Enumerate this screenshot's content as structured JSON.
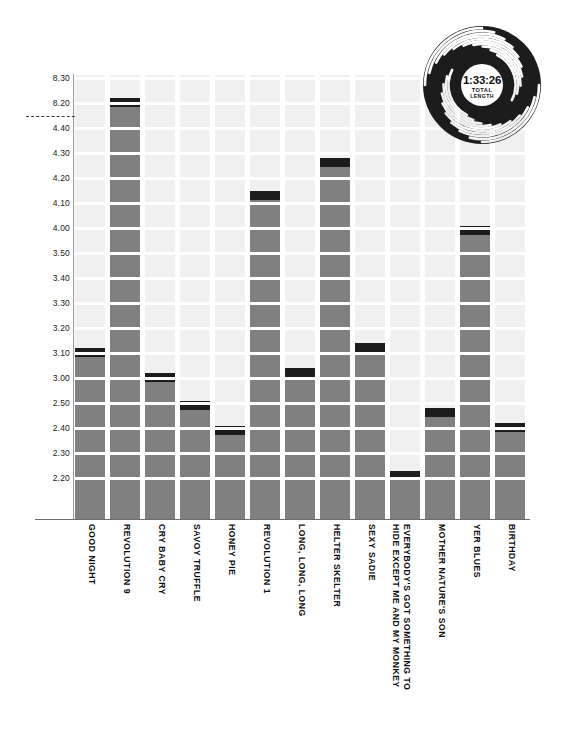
{
  "chart_data": {
    "type": "bar",
    "title": "",
    "subtitle": "",
    "xlabel": "",
    "ylabel": "",
    "grid": true,
    "legend_position": "none",
    "axis_note": "broken y-axis between 8.20 and 4.40",
    "y_unit": "minutes:seconds (track length)",
    "y_ticks": [
      "8.30",
      "8.20",
      "4.40",
      "4.30",
      "4.20",
      "4.10",
      "4.00",
      "3.50",
      "3.40",
      "3.30",
      "3.20",
      "3.10",
      "3.00",
      "2.50",
      "2.40",
      "2.30",
      "2.20"
    ],
    "ylim": [
      "2.12",
      "8.34"
    ],
    "categories": [
      "GOOD NIGHT",
      "REVOLUTION 9",
      "CRY BABY CRY",
      "SAVOY TRUFFLE",
      "HONEY PIE",
      "REVOLUTION 1",
      "LONG, LONG, LONG",
      "HELTER SKELTER",
      "SEXY SADIE",
      "EVERYBODY'S GOT SOMETHING TO HIDE EXCEPT ME AND MY MONKEY",
      "MOTHER NATURE'S SON",
      "YER BLUES",
      "BIRTHDAY"
    ],
    "values": [
      "3.12",
      "8.22",
      "3.02",
      "2.54",
      "2.41",
      "4.15",
      "3.04",
      "4.28",
      "3.14",
      "2.23",
      "2.48",
      "4.01",
      "2.42"
    ]
  },
  "badge": {
    "total_length": "1:33:26",
    "caption_line1": "TOTAL",
    "caption_line2": "LENGTH",
    "icon": "vinyl-record-icon"
  },
  "colors": {
    "bar": "#808080",
    "bar_cap": "#1c1c1c",
    "column_background": "#f0f0f0",
    "gridline": "#ffffff",
    "axis": "#6d6d6d",
    "text": "#0d0d0d",
    "page_background": "#ffffff"
  }
}
